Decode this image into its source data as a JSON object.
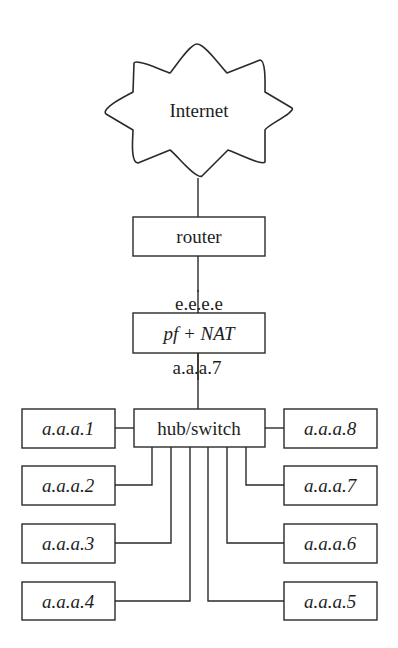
{
  "diagram": {
    "type": "network-topology",
    "cloud": {
      "label": "Internet",
      "shape": "cloud-icon"
    },
    "router": {
      "label": "router"
    },
    "firewall": {
      "label": "pf + NAT",
      "external_ip": "e.e.e.e",
      "internal_ip": "a.a.a.7"
    },
    "switch": {
      "label": "hub/switch"
    },
    "hosts_left": [
      {
        "label": "a.a.a.1"
      },
      {
        "label": "a.a.a.2"
      },
      {
        "label": "a.a.a.3"
      },
      {
        "label": "a.a.a.4"
      }
    ],
    "hosts_right": [
      {
        "label": "a.a.a.8"
      },
      {
        "label": "a.a.a.7"
      },
      {
        "label": "a.a.a.6"
      },
      {
        "label": "a.a.a.5"
      }
    ],
    "colors": {
      "stroke": "#2a2a2a",
      "text": "#1e1e1e",
      "background": "#ffffff"
    }
  }
}
